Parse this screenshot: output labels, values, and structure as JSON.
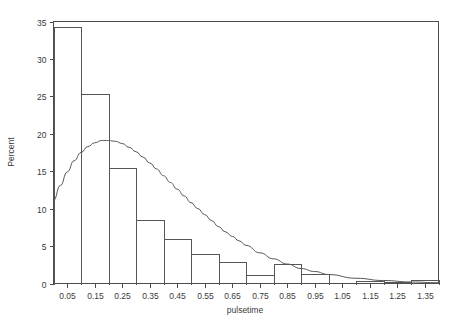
{
  "chart_data": {
    "type": "bar",
    "title": "",
    "subtitle": "",
    "xlabel": "pulsetime",
    "ylabel": "Percent",
    "xlim": [
      0.0,
      1.4
    ],
    "ylim": [
      0,
      35
    ],
    "grid": false,
    "legend": "none",
    "bin_width": 0.1,
    "x_ticks": [
      "0.05",
      "0.15",
      "0.25",
      "0.35",
      "0.45",
      "0.55",
      "0.65",
      "0.75",
      "0.85",
      "0.95",
      "1.05",
      "1.15",
      "1.25",
      "1.35"
    ],
    "x_tick_values": [
      0.05,
      0.15,
      0.25,
      0.35,
      0.45,
      0.55,
      0.65,
      0.75,
      0.85,
      0.95,
      1.05,
      1.15,
      1.25,
      1.35
    ],
    "y_ticks": [
      "0",
      "5",
      "10",
      "15",
      "20",
      "25",
      "30",
      "35"
    ],
    "y_tick_values": [
      0,
      5,
      10,
      15,
      20,
      25,
      30,
      35
    ],
    "bins": [
      {
        "center": 0.05,
        "left": 0.0,
        "right": 0.1,
        "value": 34.3
      },
      {
        "center": 0.15,
        "left": 0.1,
        "right": 0.2,
        "value": 25.3
      },
      {
        "center": 0.25,
        "left": 0.2,
        "right": 0.3,
        "value": 15.4
      },
      {
        "center": 0.35,
        "left": 0.3,
        "right": 0.4,
        "value": 8.5
      },
      {
        "center": 0.45,
        "left": 0.4,
        "right": 0.5,
        "value": 5.9
      },
      {
        "center": 0.55,
        "left": 0.5,
        "right": 0.6,
        "value": 4.0
      },
      {
        "center": 0.65,
        "left": 0.6,
        "right": 0.7,
        "value": 2.9
      },
      {
        "center": 0.75,
        "left": 0.7,
        "right": 0.8,
        "value": 1.1
      },
      {
        "center": 0.85,
        "left": 0.8,
        "right": 0.9,
        "value": 2.6
      },
      {
        "center": 0.95,
        "left": 0.9,
        "right": 1.0,
        "value": 1.3
      },
      {
        "center": 1.05,
        "left": 1.0,
        "right": 1.1,
        "value": 0.0
      },
      {
        "center": 1.15,
        "left": 1.1,
        "right": 1.2,
        "value": 0.4
      },
      {
        "center": 1.25,
        "left": 1.2,
        "right": 1.3,
        "value": 0.2
      },
      {
        "center": 1.35,
        "left": 1.3,
        "right": 1.4,
        "value": 0.5
      }
    ],
    "categories": [
      "0.05",
      "0.15",
      "0.25",
      "0.35",
      "0.45",
      "0.55",
      "0.65",
      "0.75",
      "0.85",
      "0.95",
      "1.05",
      "1.15",
      "1.25",
      "1.35"
    ],
    "values": [
      34.3,
      25.3,
      15.4,
      8.5,
      5.9,
      4.0,
      2.9,
      1.1,
      2.6,
      1.3,
      0.0,
      0.4,
      0.2,
      0.5
    ],
    "overlay_curve": {
      "name": "fitted density",
      "style": "solid",
      "x": [
        0.0,
        0.025,
        0.05,
        0.075,
        0.1,
        0.125,
        0.15,
        0.175,
        0.2,
        0.225,
        0.25,
        0.275,
        0.3,
        0.325,
        0.35,
        0.375,
        0.4,
        0.425,
        0.45,
        0.475,
        0.5,
        0.525,
        0.55,
        0.575,
        0.6,
        0.625,
        0.65,
        0.675,
        0.7,
        0.75,
        0.8,
        0.85,
        0.9,
        0.95,
        1.0,
        1.1,
        1.2,
        1.3,
        1.4
      ],
      "y": [
        11.1,
        13.1,
        14.9,
        16.4,
        17.5,
        18.3,
        18.8,
        19.1,
        19.1,
        19.0,
        18.7,
        18.2,
        17.6,
        16.9,
        16.1,
        15.3,
        14.4,
        13.5,
        12.6,
        11.7,
        10.8,
        10.0,
        9.2,
        8.4,
        7.6,
        6.9,
        6.3,
        5.7,
        5.1,
        4.1,
        3.3,
        2.6,
        2.0,
        1.6,
        1.2,
        0.7,
        0.4,
        0.2,
        0.1
      ]
    }
  },
  "axes": {
    "x_title": "pulsetime",
    "y_title": "Percent"
  }
}
